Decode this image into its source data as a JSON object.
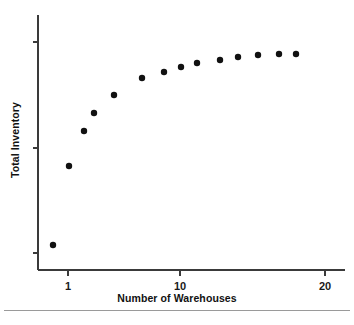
{
  "chart_data": {
    "type": "scatter",
    "title": "",
    "xlabel": "Number of Warehouses",
    "ylabel": "Total Inventory",
    "x_scale": "log",
    "y_scale": "linear",
    "xlim": [
      0.8,
      22
    ],
    "ylim": [
      0,
      100
    ],
    "grid": false,
    "legend": null,
    "x_tick_labels": [
      "1",
      "10",
      "20"
    ],
    "x_tick_values": [
      1,
      10,
      20
    ],
    "y_tick_labels": [
      "",
      "",
      ""
    ],
    "y_ticks_unlabeled": 3,
    "marker": {
      "shape": "circle",
      "color": "#111111",
      "size_px": 4.2
    },
    "points": [
      {
        "x": 0.85,
        "y": 9.5
      },
      {
        "x": 1.0,
        "y": 42.0
      },
      {
        "x": 1.45,
        "y": 62.5
      },
      {
        "x": 1.75,
        "y": 69.0
      },
      {
        "x": 2.6,
        "y": 76.0
      },
      {
        "x": 4.3,
        "y": 82.0
      },
      {
        "x": 6.3,
        "y": 84.5
      },
      {
        "x": 8.6,
        "y": 87.0
      },
      {
        "x": 11.2,
        "y": 88.5
      },
      {
        "x": 12.8,
        "y": 89.5
      },
      {
        "x": 14.3,
        "y": 90.5
      },
      {
        "x": 15.8,
        "y": 91.5
      },
      {
        "x": 17.2,
        "y": 92.0
      },
      {
        "x": 18.3,
        "y": 92.5
      }
    ],
    "pixel_points": [
      {
        "cx": 53,
        "cy": 245
      },
      {
        "cx": 69,
        "cy": 166
      },
      {
        "cx": 84,
        "cy": 131
      },
      {
        "cx": 94,
        "cy": 113
      },
      {
        "cx": 114,
        "cy": 95
      },
      {
        "cx": 142,
        "cy": 78
      },
      {
        "cx": 164,
        "cy": 72
      },
      {
        "cx": 197,
        "cy": 63
      },
      {
        "cx": 220,
        "cy": 60
      },
      {
        "cx": 238,
        "cy": 57
      },
      {
        "cx": 258,
        "cy": 54
      },
      {
        "cx": 279,
        "cy": 54
      },
      {
        "cx": 238,
        "cy": 57
      },
      {
        "cx": 279,
        "cy": 54
      }
    ],
    "axis_color": "#3a3a3a",
    "background_color": "#ffffff"
  },
  "axes": {
    "x_title": "Number of Warehouses",
    "y_title": "Total Inventory",
    "x_ticks": [
      {
        "label": "1",
        "px": 68
      },
      {
        "label": "10",
        "px": 180
      },
      {
        "label": "20",
        "px": 325
      }
    ],
    "y_ticks": [
      {
        "label": "",
        "py": 42
      },
      {
        "label": "",
        "py": 148
      },
      {
        "label": "",
        "py": 253
      }
    ]
  },
  "figure": {
    "has_footer_rule": true
  }
}
